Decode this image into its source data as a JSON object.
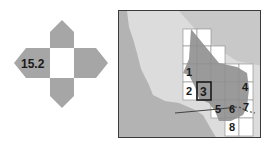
{
  "navigator": {
    "label": "15.2",
    "colors": {
      "arrow": "#a6a6a6",
      "center": "#ffffff"
    }
  },
  "map": {
    "colors": {
      "sea": "#b3b3b3",
      "land": "#dcdcdc",
      "study_area": "#8f8f8f",
      "tile": "#ffffff",
      "frame": "#333333"
    },
    "tiles": [
      {
        "id": "1",
        "label": "1"
      },
      {
        "id": "2",
        "label": "2"
      },
      {
        "id": "3",
        "label": "3",
        "selected": true
      },
      {
        "id": "4",
        "label": "4"
      },
      {
        "id": "5",
        "label": "5"
      },
      {
        "id": "6",
        "label": "6"
      },
      {
        "id": "7",
        "label": "7"
      },
      {
        "id": "8",
        "label": "8"
      }
    ]
  }
}
